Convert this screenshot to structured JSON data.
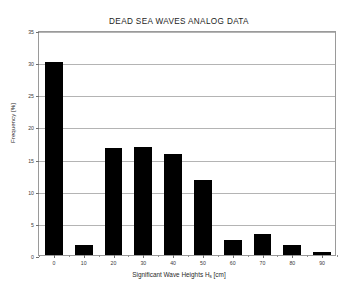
{
  "chart_data": {
    "type": "bar",
    "title": "DEAD SEA WAVES ANALOG DATA",
    "xlabel_prefix": "Significant Wave Heights H",
    "xlabel_sub": "s",
    "xlabel_suffix": " [cm]",
    "xlabel": "Significant Wave Heights Hs [cm]",
    "ylabel": "Frequency [%]",
    "categories": [
      "0",
      "10",
      "20",
      "30",
      "40",
      "50",
      "60",
      "70",
      "80",
      "90"
    ],
    "values": [
      30.0,
      1.6,
      16.6,
      16.8,
      15.7,
      11.6,
      2.3,
      3.3,
      1.6,
      0.5
    ],
    "xlim": [
      -5,
      95
    ],
    "ylim": [
      0,
      35
    ],
    "yticks": [
      0,
      5,
      10,
      15,
      20,
      25,
      30,
      35
    ],
    "ytick_labels": [
      "0",
      "5",
      "10",
      "15",
      "20",
      "25",
      "30",
      "35"
    ],
    "xticks": [
      0,
      10,
      20,
      30,
      40,
      50,
      60,
      70,
      80,
      90
    ],
    "xtick_labels": [
      "0",
      "10",
      "20",
      "30",
      "40",
      "50",
      "60",
      "70",
      "80",
      "90"
    ],
    "x_minor_ticks": [
      -5,
      5,
      15,
      25,
      35,
      45,
      55,
      65,
      75,
      85,
      95
    ],
    "grid": true,
    "grid_axis": "y",
    "legend": false,
    "bar_color": "#000000",
    "grid_color": "#b4b4b4",
    "axis_color": "#9a9a9a",
    "background_color": "#ffffff",
    "bar_width_units": 6.0
  }
}
